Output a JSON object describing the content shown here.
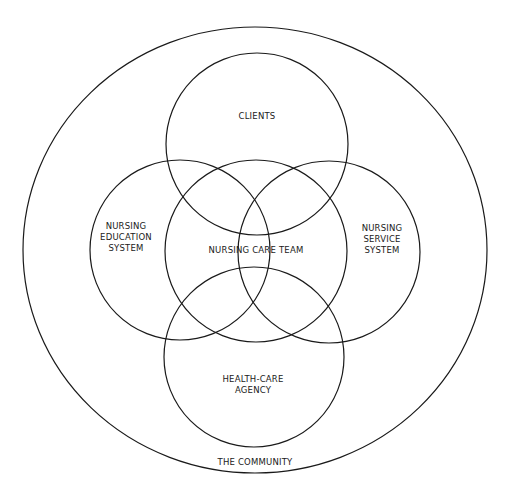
{
  "diagram": {
    "community": {
      "label": "THE COMMUNITY",
      "shape": {
        "cx": 255,
        "cy": 250,
        "rx": 232,
        "ry": 223
      },
      "label_pos": {
        "x": 255,
        "y": 465
      }
    },
    "circles": [
      {
        "id": "clients",
        "lines": [
          "CLIENTS"
        ],
        "cx": 257,
        "cy": 144,
        "r": 91,
        "label_x": 257,
        "label_y": 119
      },
      {
        "id": "nursing-education-system",
        "lines": [
          "NURSING",
          "EDUCATION",
          "SYSTEM"
        ],
        "cx": 180,
        "cy": 250,
        "r": 90,
        "label_x": 126,
        "label_y": 240
      },
      {
        "id": "nursing-care-team",
        "lines": [
          "NURSING CARE TEAM"
        ],
        "cx": 256,
        "cy": 251,
        "r": 91,
        "label_x": 256,
        "label_y": 253
      },
      {
        "id": "nursing-service-system",
        "lines": [
          "NURSING",
          "SERVICE",
          "SYSTEM"
        ],
        "cx": 329,
        "cy": 252,
        "r": 91,
        "label_x": 382,
        "label_y": 242
      },
      {
        "id": "health-care-agency",
        "lines": [
          "HEALTH-CARE",
          "AGENCY"
        ],
        "cx": 254,
        "cy": 357,
        "r": 90,
        "label_x": 253,
        "label_y": 387
      }
    ]
  }
}
